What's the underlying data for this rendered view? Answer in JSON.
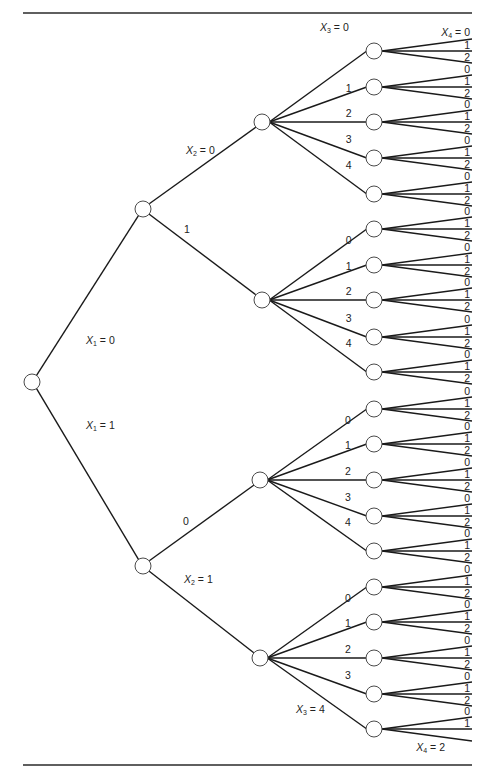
{
  "diagram": {
    "type": "probability-tree",
    "variables": [
      "X1",
      "X2",
      "X3",
      "X4"
    ],
    "domains": {
      "X1": [
        0,
        1
      ],
      "X2": [
        0,
        1
      ],
      "X3": [
        0,
        1,
        2,
        3,
        4
      ],
      "X4": [
        0,
        1,
        2
      ]
    },
    "labels": {
      "x1_0": {
        "var": "X",
        "sub": "1",
        "eq": " = 0"
      },
      "x1_1": {
        "var": "X",
        "sub": "1",
        "eq": " = 1"
      },
      "x2_0": {
        "var": "X",
        "sub": "2",
        "eq": " = 0"
      },
      "x2_1": {
        "var": "X",
        "sub": "2",
        "eq": " = 1"
      },
      "x3_0": {
        "var": "X",
        "sub": "3",
        "eq": " = 0"
      },
      "x3_4": {
        "var": "X",
        "sub": "3",
        "eq": " = 4"
      },
      "x4_0": {
        "var": "X",
        "sub": "4",
        "eq": " = 0"
      },
      "x4_2": {
        "var": "X",
        "sub": "4",
        "eq": " = 2"
      }
    },
    "x2_short_labels": {
      "upper_branch_1": "1",
      "lower_branch_0": "0"
    },
    "x3_values": [
      "0",
      "1",
      "2",
      "3",
      "4"
    ],
    "x4_values": [
      "0",
      "1",
      "2"
    ],
    "colors": {
      "stroke": "#1a1a1a",
      "node_fill": "#ffffff",
      "node_stroke": "#4a4a4a",
      "text": "#222222"
    }
  }
}
